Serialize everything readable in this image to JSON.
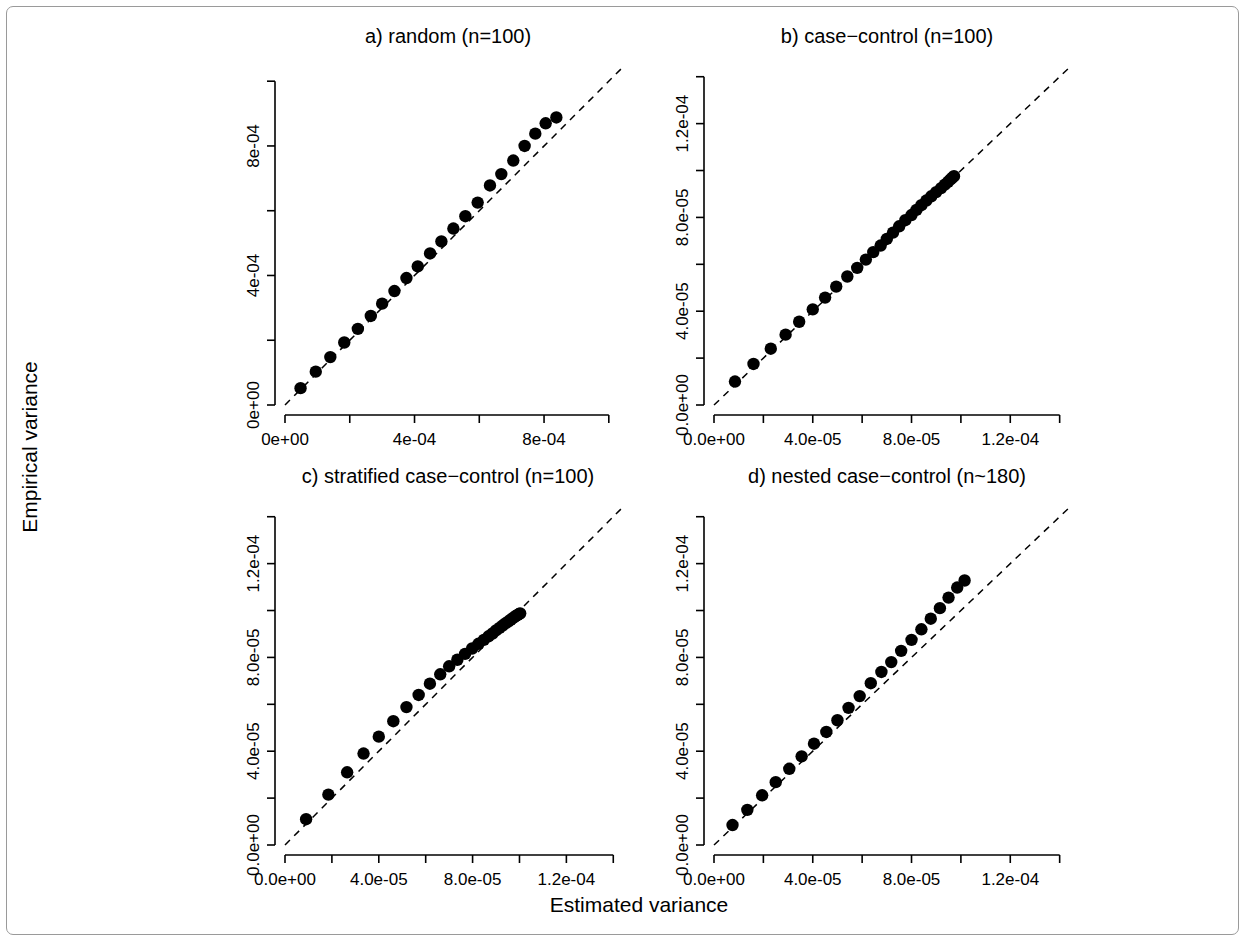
{
  "figure": {
    "xlabel": "Estimated variance",
    "ylabel": "Empirical  variance",
    "background": "#ffffff",
    "foreground": "#000000",
    "border_color": "#9a9a9a"
  },
  "chart_data": [
    {
      "type": "scatter",
      "panel": "a",
      "title": "a) random (n=100)",
      "xlabel": "Estimated variance",
      "ylabel": "Empirical  variance",
      "xlim": [
        0,
        0.00105
      ],
      "ylim": [
        0,
        0.00105
      ],
      "xticks": [
        0,
        0.0002,
        0.0004,
        0.0006,
        0.0008,
        0.001
      ],
      "xticklabels": [
        "0e+00",
        "",
        "4e-04",
        "",
        "8e-04",
        ""
      ],
      "yticks": [
        0,
        0.0002,
        0.0004,
        0.0006,
        0.0008,
        0.001
      ],
      "yticklabels": [
        "0e+00",
        "",
        "4e-04",
        "",
        "8e-04",
        ""
      ],
      "grid": false,
      "reference_line": {
        "type": "identity",
        "style": "dashed",
        "slope": 1,
        "intercept": 0
      },
      "x": [
        4.8e-05,
        9.5e-05,
        0.00014,
        0.000183,
        0.000225,
        0.000265,
        0.0003,
        0.000338,
        0.000375,
        0.00041,
        0.000448,
        0.000483,
        0.00052,
        0.000557,
        0.000595,
        0.000633,
        0.000668,
        0.000705,
        0.00074,
        0.000773,
        0.000805,
        0.000838
      ],
      "y": [
        5.2e-05,
        0.000103,
        0.000148,
        0.000193,
        0.000235,
        0.000275,
        0.000313,
        0.000352,
        0.000392,
        0.000428,
        0.000468,
        0.000505,
        0.000545,
        0.000583,
        0.000625,
        0.000678,
        0.000713,
        0.000755,
        0.0008,
        0.000838,
        0.00087,
        0.000888
      ]
    },
    {
      "type": "scatter",
      "panel": "b",
      "title": "b) case−control (n=100)",
      "xlabel": "Estimated variance",
      "ylabel": "Empirical  variance",
      "xlim": [
        0,
        0.000145
      ],
      "ylim": [
        0,
        0.000145
      ],
      "xticks": [
        0,
        2e-05,
        4e-05,
        6e-05,
        8e-05,
        0.0001,
        0.00012,
        0.00014
      ],
      "xticklabels": [
        "0.0e+00",
        "",
        "4.0e-05",
        "",
        "8.0e-05",
        "",
        "1.2e-04",
        ""
      ],
      "yticks": [
        0,
        2e-05,
        4e-05,
        6e-05,
        8e-05,
        0.0001,
        0.00012,
        0.00014
      ],
      "yticklabels": [
        "0.0e+00",
        "",
        "4.0e-05",
        "",
        "8.0e-05",
        "",
        "1.2e-04",
        ""
      ],
      "grid": false,
      "reference_line": {
        "type": "identity",
        "style": "dashed",
        "slope": 1,
        "intercept": 0
      },
      "x": [
        8.5e-06,
        1.6e-05,
        2.3e-05,
        2.9e-05,
        3.45e-05,
        4e-05,
        4.5e-05,
        4.95e-05,
        5.4e-05,
        5.8e-05,
        6.15e-05,
        6.45e-05,
        6.75e-05,
        7e-05,
        7.25e-05,
        7.5e-05,
        7.75e-05,
        8e-05,
        8.2e-05,
        8.4e-05,
        8.6e-05,
        8.8e-05,
        9e-05,
        9.2e-05,
        9.35e-05,
        9.48e-05,
        9.58e-05,
        9.66e-05,
        9.72e-05
      ],
      "y": [
        1e-05,
        1.75e-05,
        2.4e-05,
        3e-05,
        3.55e-05,
        4.08e-05,
        4.58e-05,
        5.05e-05,
        5.48e-05,
        5.85e-05,
        6.2e-05,
        6.52e-05,
        6.8e-05,
        7.08e-05,
        7.35e-05,
        7.62e-05,
        7.88e-05,
        8.1e-05,
        8.32e-05,
        8.52e-05,
        8.72e-05,
        8.9e-05,
        9.08e-05,
        9.25e-05,
        9.4e-05,
        9.52e-05,
        9.62e-05,
        9.7e-05,
        9.76e-05
      ]
    },
    {
      "type": "scatter",
      "panel": "c",
      "title": "c) stratified case−control (n=100)",
      "xlabel": "Estimated variance",
      "ylabel": "Empirical  variance",
      "xlim": [
        0,
        0.000145
      ],
      "ylim": [
        0,
        0.000145
      ],
      "xticks": [
        0,
        2e-05,
        4e-05,
        6e-05,
        8e-05,
        0.0001,
        0.00012,
        0.00014
      ],
      "xticklabels": [
        "0.0e+00",
        "",
        "4.0e-05",
        "",
        "8.0e-05",
        "",
        "1.2e-04",
        ""
      ],
      "yticks": [
        0,
        2e-05,
        4e-05,
        6e-05,
        8e-05,
        0.0001,
        0.00012,
        0.00014
      ],
      "yticklabels": [
        "0.0e+00",
        "",
        "4.0e-05",
        "",
        "8.0e-05",
        "",
        "1.2e-04",
        ""
      ],
      "grid": false,
      "reference_line": {
        "type": "identity",
        "style": "dashed",
        "slope": 1,
        "intercept": 0
      },
      "x": [
        9e-06,
        1.85e-05,
        2.65e-05,
        3.35e-05,
        4e-05,
        4.62e-05,
        5.18e-05,
        5.7e-05,
        6.18e-05,
        6.62e-05,
        7e-05,
        7.35e-05,
        7.68e-05,
        7.98e-05,
        8.25e-05,
        8.48e-05,
        8.68e-05,
        8.85e-05,
        9e-05,
        9.15e-05,
        9.28e-05,
        9.4e-05,
        9.52e-05,
        9.62e-05,
        9.7e-05,
        9.78e-05,
        9.85e-05,
        9.92e-05,
        9.98e-05,
        0.0001003
      ],
      "y": [
        1.1e-05,
        2.15e-05,
        3.1e-05,
        3.9e-05,
        4.62e-05,
        5.28e-05,
        5.88e-05,
        6.4e-05,
        6.88e-05,
        7.28e-05,
        7.62e-05,
        7.9e-05,
        8.15e-05,
        8.38e-05,
        8.58e-05,
        8.75e-05,
        8.9e-05,
        9.02e-05,
        9.15e-05,
        9.26e-05,
        9.36e-05,
        9.45e-05,
        9.53e-05,
        9.6e-05,
        9.66e-05,
        9.72e-05,
        9.77e-05,
        9.81e-05,
        9.85e-05,
        9.88e-05
      ]
    },
    {
      "type": "scatter",
      "panel": "d",
      "title": "d) nested case−control (n~180)",
      "xlabel": "Estimated variance",
      "ylabel": "Empirical  variance",
      "xlim": [
        0,
        0.000145
      ],
      "ylim": [
        0,
        0.000145
      ],
      "xticks": [
        0,
        2e-05,
        4e-05,
        6e-05,
        8e-05,
        0.0001,
        0.00012,
        0.00014
      ],
      "xticklabels": [
        "0.0e+00",
        "",
        "4.0e-05",
        "",
        "8.0e-05",
        "",
        "1.2e-04",
        ""
      ],
      "yticks": [
        0,
        2e-05,
        4e-05,
        6e-05,
        8e-05,
        0.0001,
        0.00012,
        0.00014
      ],
      "yticklabels": [
        "0.0e+00",
        "",
        "4.0e-05",
        "",
        "8.0e-05",
        "",
        "1.2e-04",
        ""
      ],
      "grid": false,
      "reference_line": {
        "type": "identity",
        "style": "dashed",
        "slope": 1,
        "intercept": 0
      },
      "x": [
        7.5e-06,
        1.35e-05,
        1.95e-05,
        2.5e-05,
        3.05e-05,
        3.55e-05,
        4.05e-05,
        4.55e-05,
        5e-05,
        5.45e-05,
        5.9e-05,
        6.35e-05,
        6.78e-05,
        7.18e-05,
        7.58e-05,
        8e-05,
        8.4e-05,
        8.78e-05,
        9.15e-05,
        9.5e-05,
        9.85e-05,
        0.0001015
      ],
      "y": [
        8.5e-06,
        1.5e-05,
        2.12e-05,
        2.68e-05,
        3.25e-05,
        3.78e-05,
        4.32e-05,
        4.82e-05,
        5.32e-05,
        5.85e-05,
        6.35e-05,
        6.9e-05,
        7.38e-05,
        7.8e-05,
        8.28e-05,
        8.75e-05,
        9.2e-05,
        9.65e-05,
        0.000101,
        0.0001055,
        0.0001098,
        0.0001128
      ]
    }
  ]
}
